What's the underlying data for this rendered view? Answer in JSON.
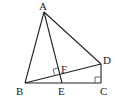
{
  "diagram": {
    "type": "geometry",
    "points": {
      "A": {
        "x": 44,
        "y": 12,
        "label": "A",
        "lx": 39,
        "ly": 10
      },
      "B": {
        "x": 25,
        "y": 83,
        "label": "B",
        "lx": 16,
        "ly": 95
      },
      "C": {
        "x": 101,
        "y": 83,
        "label": "C",
        "lx": 100,
        "ly": 95
      },
      "D": {
        "x": 101,
        "y": 64,
        "label": "D",
        "lx": 103,
        "ly": 64
      },
      "E": {
        "x": 62,
        "y": 83,
        "label": "E",
        "lx": 58,
        "ly": 95
      },
      "F": {
        "x": 60,
        "y": 73,
        "label": "F",
        "lx": 61,
        "ly": 73
      }
    },
    "segments": [
      [
        "A",
        "B"
      ],
      [
        "A",
        "D"
      ],
      [
        "A",
        "E"
      ],
      [
        "B",
        "D"
      ],
      [
        "B",
        "C"
      ],
      [
        "D",
        "C"
      ]
    ],
    "right_angles": [
      "C",
      "F"
    ]
  }
}
